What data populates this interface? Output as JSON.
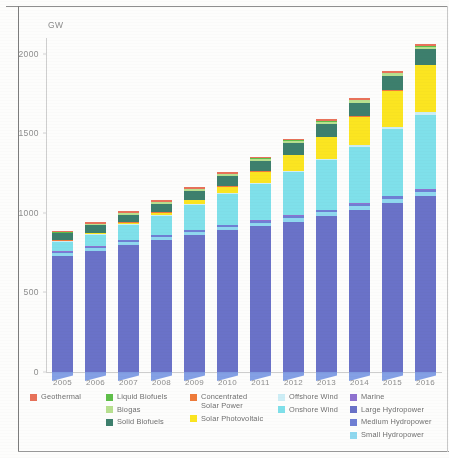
{
  "chart_data": {
    "type": "bar",
    "stacked": true,
    "title": "",
    "subtitle": "",
    "xlabel": "",
    "ylabel": "GW",
    "ylim": [
      0,
      2100
    ],
    "yticks": [
      0,
      500,
      1000,
      1500,
      2000
    ],
    "ytick_labels": [
      "0",
      "500",
      "1000",
      "1500",
      "2000"
    ],
    "grid": false,
    "legend_position": "bottom",
    "categories": [
      "2005",
      "2006",
      "2007",
      "2008",
      "2009",
      "2010",
      "2011",
      "2012",
      "2013",
      "2014",
      "2015",
      "2016"
    ],
    "series": [
      {
        "name": "Large Hydropower",
        "color": "#6a72c8",
        "values": [
          730,
          760,
          800,
          830,
          860,
          890,
          915,
          945,
          980,
          1020,
          1065,
          1105
        ]
      },
      {
        "name": "Small Hydropower",
        "color": "#8fd8ef",
        "values": [
          16,
          17,
          18,
          19,
          20,
          21,
          22,
          23,
          24,
          25,
          26,
          27
        ]
      },
      {
        "name": "Medium Hydropower",
        "color": "#6f7fd4",
        "values": [
          10,
          10,
          11,
          11,
          12,
          12,
          13,
          13,
          14,
          14,
          15,
          15
        ]
      },
      {
        "name": "Marine",
        "color": "#8f72d0",
        "values": [
          1,
          1,
          1,
          1,
          1,
          1,
          1,
          1,
          1,
          1,
          1,
          1
        ]
      },
      {
        "name": "Onshore Wind",
        "color": "#7fe0ea",
        "values": [
          58,
          72,
          92,
          118,
          156,
          195,
          228,
          272,
          310,
          355,
          418,
          468
        ]
      },
      {
        "name": "Offshore Wind",
        "color": "#cdeef6",
        "values": [
          1,
          1,
          1,
          2,
          2,
          3,
          4,
          5,
          7,
          9,
          12,
          14
        ]
      },
      {
        "name": "Solar Photovoltaic",
        "color": "#fbe521",
        "values": [
          5,
          7,
          9,
          16,
          24,
          41,
          72,
          102,
          138,
          178,
          228,
          295
        ]
      },
      {
        "name": "Concentrated Solar Power",
        "color": "#ef7b3a",
        "values": [
          0.4,
          0.4,
          0.5,
          0.6,
          0.7,
          1.3,
          1.8,
          2.6,
          3.4,
          4.4,
          4.8,
          4.9
        ]
      },
      {
        "name": "Solid Biofuels",
        "color": "#3d7f6d",
        "values": [
          42,
          45,
          49,
          53,
          57,
          62,
          67,
          72,
          78,
          84,
          90,
          96
        ]
      },
      {
        "name": "Biogas",
        "color": "#b7e08f",
        "values": [
          5,
          6,
          7,
          8,
          9,
          11,
          12,
          13,
          14,
          15,
          16,
          17
        ]
      },
      {
        "name": "Liquid Biofuels",
        "color": "#5fbf4a",
        "values": [
          1,
          1,
          2,
          2,
          2,
          2,
          2,
          2,
          3,
          3,
          3,
          3
        ]
      },
      {
        "name": "Geothermal",
        "color": "#e8725a",
        "values": [
          9,
          9,
          10,
          10,
          10,
          11,
          11,
          11,
          12,
          12,
          13,
          13
        ]
      }
    ],
    "totals": [
      878,
      929,
      1000,
      1090,
      1153,
      1250,
      1348,
      1461,
      1584,
      1719,
      1891,
      2059
    ]
  },
  "axis": {
    "y_unit": "GW",
    "ytick_labels": [
      "2000",
      "1500",
      "1000",
      "500",
      "0"
    ],
    "xtick_labels": [
      "2005",
      "2006",
      "2007",
      "2008",
      "2009",
      "2010",
      "2011",
      "2012",
      "2013",
      "2014",
      "2015",
      "2016"
    ]
  },
  "legend": {
    "columns": [
      {
        "items": [
          {
            "label": "Geothermal",
            "color": "#e8725a"
          }
        ]
      },
      {
        "items": [
          {
            "label": "Liquid Biofuels",
            "color": "#5fbf4a"
          },
          {
            "label": "Biogas",
            "color": "#b7e08f"
          },
          {
            "label": "Solid Biofuels",
            "color": "#3d7f6d"
          }
        ]
      },
      {
        "items": [
          {
            "label": "Concentrated\nSolar Power",
            "color": "#ef7b3a"
          },
          {
            "label": "Solar Photovoltaic",
            "color": "#fbe521"
          }
        ]
      },
      {
        "items": [
          {
            "label": "Offshore Wind",
            "color": "#cdeef6"
          },
          {
            "label": "Onshore Wind",
            "color": "#7fe0ea"
          }
        ]
      },
      {
        "items": [
          {
            "label": "Marine",
            "color": "#8f72d0"
          },
          {
            "label": "Large Hydropower",
            "color": "#6a72c8"
          },
          {
            "label": "Medium Hydropower",
            "color": "#6f7fd4"
          },
          {
            "label": "Small Hydropower",
            "color": "#8fd8ef"
          }
        ]
      }
    ]
  }
}
